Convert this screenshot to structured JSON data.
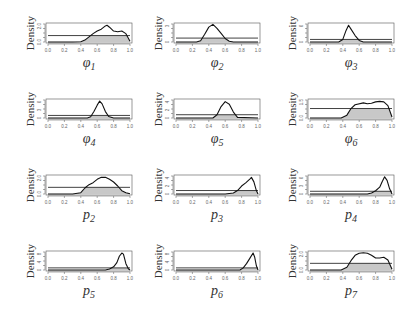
{
  "chart_data": [
    {
      "type": "line",
      "title": "",
      "xlabel": "φ1",
      "ylabel": "Density",
      "xlim": [
        0,
        1
      ],
      "yticks": [
        "0.0",
        "2.0"
      ],
      "ymax": 2.8,
      "prior_level": 1.0,
      "grid": false,
      "posterior": {
        "x": [
          0,
          0.3,
          0.4,
          0.45,
          0.5,
          0.55,
          0.6,
          0.65,
          0.7,
          0.72,
          0.75,
          0.8,
          0.85,
          0.9,
          0.95,
          1.0
        ],
        "y": [
          0,
          0,
          0.05,
          0.3,
          0.8,
          1.3,
          1.7,
          2.0,
          2.5,
          2.6,
          2.3,
          1.7,
          1.6,
          1.7,
          1.3,
          0.1
        ]
      }
    },
    {
      "type": "line",
      "title": "",
      "xlabel": "φ2",
      "ylabel": "Density",
      "xlim": [
        0,
        1
      ],
      "yticks": [
        "0",
        "3"
      ],
      "ymax": 4.6,
      "prior_level": 1.0,
      "grid": false,
      "posterior": {
        "x": [
          0,
          0.25,
          0.3,
          0.35,
          0.4,
          0.45,
          0.5,
          0.55,
          0.6,
          0.65,
          0.7,
          1.0
        ],
        "y": [
          0,
          0,
          0.3,
          2.0,
          3.8,
          4.5,
          3.5,
          2.2,
          0.9,
          0.2,
          0,
          0
        ]
      }
    },
    {
      "type": "line",
      "title": "",
      "xlabel": "φ3",
      "ylabel": "Density",
      "xlim": [
        0,
        1
      ],
      "yticks": [
        "0",
        "2",
        "6"
      ],
      "ymax": 7.0,
      "prior_level": 1.0,
      "grid": false,
      "posterior": {
        "x": [
          0,
          0.35,
          0.4,
          0.44,
          0.47,
          0.5,
          0.55,
          0.6,
          0.65,
          1.0
        ],
        "y": [
          0,
          0,
          1.0,
          4.5,
          6.5,
          5.0,
          2.5,
          0.6,
          0,
          0
        ]
      }
    },
    {
      "type": "line",
      "title": "",
      "xlabel": "φ4",
      "ylabel": "Density",
      "xlim": [
        0,
        1
      ],
      "yticks": [
        "0",
        "2",
        "4",
        "6"
      ],
      "ymax": 7.0,
      "prior_level": 1.0,
      "grid": false,
      "posterior": {
        "x": [
          0,
          0.48,
          0.52,
          0.56,
          0.6,
          0.63,
          0.66,
          0.7,
          0.74,
          0.8,
          1.0
        ],
        "y": [
          0,
          0,
          0.5,
          2.5,
          5.0,
          6.6,
          5.5,
          2.5,
          0.6,
          0,
          0
        ]
      }
    },
    {
      "type": "line",
      "title": "",
      "xlabel": "φ5",
      "ylabel": "Density",
      "xlim": [
        0,
        1
      ],
      "yticks": [
        "0",
        "2",
        "4"
      ],
      "ymax": 5.5,
      "prior_level": 1.0,
      "grid": false,
      "posterior": {
        "x": [
          0,
          0.45,
          0.5,
          0.55,
          0.6,
          0.65,
          0.7,
          0.75,
          1.0
        ],
        "y": [
          0,
          0,
          1.0,
          3.5,
          5.0,
          4.2,
          1.8,
          0.2,
          0
        ]
      }
    },
    {
      "type": "line",
      "title": "",
      "xlabel": "φ6",
      "ylabel": "Density",
      "xlim": [
        0,
        1
      ],
      "yticks": [
        "0.0",
        "1.5"
      ],
      "ymax": 1.9,
      "prior_level": 1.0,
      "grid": false,
      "posterior": {
        "x": [
          0,
          0.38,
          0.45,
          0.5,
          0.55,
          0.65,
          0.7,
          0.75,
          0.8,
          0.85,
          0.9,
          0.95,
          1.0
        ],
        "y": [
          0,
          0,
          0.3,
          1.0,
          1.4,
          1.6,
          1.5,
          1.55,
          1.7,
          1.75,
          1.7,
          1.3,
          0.1
        ]
      }
    },
    {
      "type": "line",
      "title": "",
      "xlabel": "p2",
      "ylabel": "Density",
      "xlim": [
        0,
        1
      ],
      "yticks": [
        "0.0",
        "2.0"
      ],
      "ymax": 2.7,
      "prior_level": 1.0,
      "grid": false,
      "posterior": {
        "x": [
          0,
          0.3,
          0.4,
          0.45,
          0.5,
          0.55,
          0.6,
          0.65,
          0.7,
          0.75,
          0.8,
          0.85,
          0.9,
          0.95,
          1.0
        ],
        "y": [
          0,
          0,
          0.2,
          0.9,
          1.4,
          1.7,
          2.2,
          2.5,
          2.5,
          2.2,
          1.8,
          1.2,
          0.5,
          0.2,
          0.05
        ]
      }
    },
    {
      "type": "line",
      "title": "",
      "xlabel": "p3",
      "ylabel": "Density",
      "xlim": [
        0,
        1
      ],
      "yticks": [
        "0",
        "2",
        "4"
      ],
      "ymax": 5.2,
      "prior_level": 1.0,
      "grid": false,
      "posterior": {
        "x": [
          0,
          0.6,
          0.7,
          0.75,
          0.8,
          0.85,
          0.9,
          0.92,
          0.95,
          0.98,
          1.0
        ],
        "y": [
          0,
          0,
          0.3,
          1.0,
          2.3,
          3.2,
          4.3,
          4.8,
          3.5,
          1.0,
          0
        ]
      }
    },
    {
      "type": "line",
      "title": "",
      "xlabel": "p4",
      "ylabel": "Density",
      "xlim": [
        0,
        1
      ],
      "yticks": [
        "0",
        "2",
        "4",
        "6"
      ],
      "ymax": 6.6,
      "prior_level": 1.0,
      "grid": false,
      "posterior": {
        "x": [
          0,
          0.7,
          0.75,
          0.8,
          0.85,
          0.88,
          0.91,
          0.94,
          0.97,
          1.0
        ],
        "y": [
          0,
          0,
          0.4,
          1.2,
          2.5,
          4.5,
          6.3,
          5.0,
          2.0,
          0
        ]
      }
    },
    {
      "type": "line",
      "title": "",
      "xlabel": "p5",
      "ylabel": "Density",
      "xlim": [
        0,
        1
      ],
      "yticks": [
        "0",
        "2",
        "4",
        "6",
        "8"
      ],
      "ymax": 8.5,
      "prior_level": 1.0,
      "grid": false,
      "posterior": {
        "x": [
          0,
          0.7,
          0.75,
          0.8,
          0.84,
          0.87,
          0.9,
          0.92,
          0.95,
          0.98,
          1.0
        ],
        "y": [
          0,
          0,
          0.5,
          1.5,
          3.5,
          6.5,
          8.0,
          7.5,
          3.0,
          0.6,
          0
        ]
      }
    },
    {
      "type": "line",
      "title": "",
      "xlabel": "p6",
      "ylabel": "Density",
      "xlim": [
        0,
        1
      ],
      "yticks": [
        "0",
        "2",
        "4",
        "6",
        "8"
      ],
      "ymax": 8.5,
      "prior_level": 1.0,
      "grid": false,
      "posterior": {
        "x": [
          0,
          0.78,
          0.82,
          0.86,
          0.9,
          0.94,
          0.96,
          0.98,
          1.0
        ],
        "y": [
          0,
          0,
          1.0,
          3.0,
          5.5,
          8.0,
          6.0,
          2.0,
          0
        ]
      }
    },
    {
      "type": "line",
      "title": "",
      "xlabel": "p7",
      "ylabel": "Density",
      "xlim": [
        0,
        1
      ],
      "yticks": [
        "0.0",
        "2.0"
      ],
      "ymax": 2.7,
      "prior_level": 1.0,
      "grid": false,
      "posterior": {
        "x": [
          0,
          0.38,
          0.45,
          0.5,
          0.55,
          0.6,
          0.65,
          0.7,
          0.75,
          0.8,
          0.85,
          0.9,
          0.95,
          1.0
        ],
        "y": [
          0,
          0,
          0.4,
          1.4,
          2.2,
          2.5,
          2.6,
          2.5,
          2.2,
          1.8,
          1.8,
          1.9,
          1.5,
          0.1
        ]
      }
    }
  ],
  "panels": [
    {
      "ylabel": "Density",
      "xlabel_base": "φ",
      "xlabel_sub": "1",
      "yticks": [
        "0.0",
        "2.0"
      ]
    },
    {
      "ylabel": "Density",
      "xlabel_base": "φ",
      "xlabel_sub": "2",
      "yticks": [
        "0",
        "3"
      ]
    },
    {
      "ylabel": "Density",
      "xlabel_base": "φ",
      "xlabel_sub": "3",
      "yticks": [
        "0",
        "6"
      ]
    },
    {
      "ylabel": "Density",
      "xlabel_base": "φ",
      "xlabel_sub": "4",
      "yticks": [
        "0",
        "3",
        "6"
      ]
    },
    {
      "ylabel": "Density",
      "xlabel_base": "φ",
      "xlabel_sub": "5",
      "yticks": [
        "0",
        "2",
        "4"
      ]
    },
    {
      "ylabel": "Density",
      "xlabel_base": "φ",
      "xlabel_sub": "6",
      "yticks": [
        "0.0",
        "1.5"
      ]
    },
    {
      "ylabel": "Density",
      "xlabel_base": "p",
      "xlabel_sub": "2",
      "yticks": [
        "0.0",
        "2.0"
      ]
    },
    {
      "ylabel": "Density",
      "xlabel_base": "p",
      "xlabel_sub": "3",
      "yticks": [
        "0",
        "2",
        "4"
      ]
    },
    {
      "ylabel": "Density",
      "xlabel_base": "p",
      "xlabel_sub": "4",
      "yticks": [
        "0",
        "3",
        "6"
      ]
    },
    {
      "ylabel": "Density",
      "xlabel_base": "p",
      "xlabel_sub": "5",
      "yticks": [
        "0",
        "4",
        "8"
      ]
    },
    {
      "ylabel": "Density",
      "xlabel_base": "p",
      "xlabel_sub": "6",
      "yticks": [
        "0",
        "4",
        "8"
      ]
    },
    {
      "ylabel": "Density",
      "xlabel_base": "p",
      "xlabel_sub": "7",
      "yticks": [
        "0.0",
        "2.0"
      ]
    }
  ],
  "xticks": [
    "0.0",
    "0.2",
    "0.4",
    "0.6",
    "0.8",
    "1.0"
  ],
  "colors": {
    "line": "#111111",
    "fill": "#c8c8c8",
    "axis": "#555555",
    "box": "#555555",
    "text": "#333333"
  }
}
